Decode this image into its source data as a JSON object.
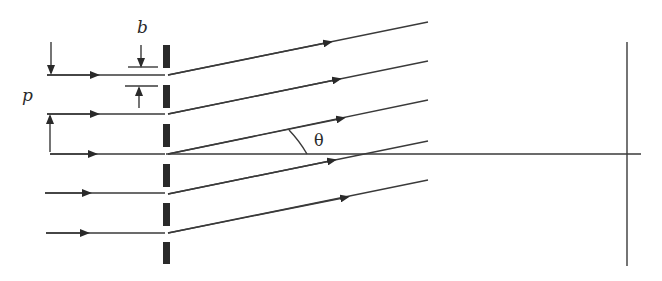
{
  "diagram": {
    "labels": {
      "slit_width": "b",
      "grating_period": "p",
      "angle": "θ"
    },
    "incident_ray_count": 5,
    "grating_bar_count": 6,
    "elements": [
      "incident-rays",
      "grating",
      "diffracted-rays",
      "optical-axis",
      "screen"
    ]
  }
}
